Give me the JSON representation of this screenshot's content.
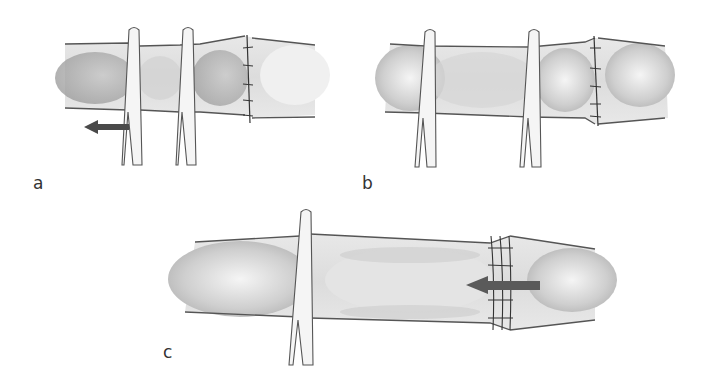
{
  "figure": {
    "panels": [
      {
        "id": "a",
        "label": "a",
        "description": "Vessel segment held by two forceps with sutured anastomosis; arrow pointing left below"
      },
      {
        "id": "b",
        "label": "b",
        "description": "Vessel segment held by two forceps with sutured anastomosis"
      },
      {
        "id": "c",
        "label": "c",
        "description": "Vessel held by single forceps; sutured anastomosis with arrow pointing left"
      }
    ],
    "colors": {
      "background": "#ffffff",
      "outline": "#555555",
      "vessel_fill": "#e6e6e6",
      "vessel_shade": "#bdbdbd",
      "arrow": "#4a4a4a",
      "suture": "#333333"
    }
  }
}
